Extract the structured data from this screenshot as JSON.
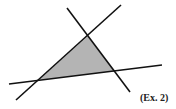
{
  "figure": {
    "label": "(Ex. 2)",
    "colors": {
      "line": "#111111",
      "fill": "#b4b4b4",
      "background": "#ffffff"
    },
    "lines": [
      {
        "name": "line-a",
        "x1": 67,
        "y1": 8,
        "x2": 130,
        "y2": 92
      },
      {
        "name": "line-b",
        "x1": 16,
        "y1": 100,
        "x2": 121,
        "y2": 5
      },
      {
        "name": "line-c",
        "x1": 9,
        "y1": 84,
        "x2": 162,
        "y2": 65
      }
    ],
    "shaded_triangle": {
      "points": "88,36 39,80 115,71"
    }
  }
}
